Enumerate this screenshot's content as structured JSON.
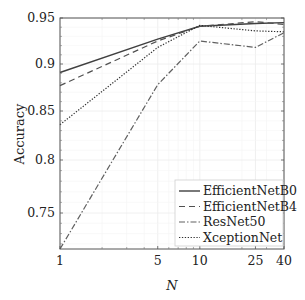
{
  "chart_data": {
    "type": "line",
    "title": "",
    "xlabel": "N",
    "ylabel": "Accuracy",
    "x_scale": "log",
    "x": [
      1,
      5,
      10,
      25,
      40
    ],
    "xticks": [
      1,
      5,
      10,
      25,
      40
    ],
    "xtick_labels": [
      "1",
      "5",
      "10",
      "25",
      "40"
    ],
    "xlim": [
      1,
      40
    ],
    "yticks": [
      0.75,
      0.8,
      0.85,
      0.9,
      0.95
    ],
    "ytick_labels": [
      "0.75",
      "0.8",
      "0.85",
      "0.9",
      "0.95"
    ],
    "ylim": [
      0.715,
      0.95
    ],
    "grid": true,
    "legend_position": "lower right",
    "series": [
      {
        "name": "EfficientNetB0",
        "style": "solid",
        "color": "#404040",
        "values": [
          0.891,
          0.927,
          0.941,
          0.944,
          0.945
        ]
      },
      {
        "name": "EfficientNetB4",
        "style": "dashed",
        "color": "#505050",
        "values": [
          0.877,
          0.925,
          0.941,
          0.946,
          0.943
        ]
      },
      {
        "name": "ResNet50",
        "style": "dashdot",
        "color": "#606060",
        "values": [
          0.715,
          0.878,
          0.925,
          0.918,
          0.934
        ]
      },
      {
        "name": "XceptionNet",
        "style": "dotted",
        "color": "#303030",
        "values": [
          0.836,
          0.918,
          0.942,
          0.936,
          0.935
        ]
      }
    ]
  }
}
